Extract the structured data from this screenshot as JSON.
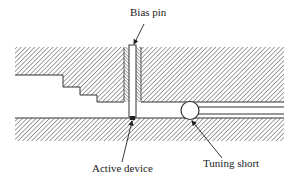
{
  "diagram": {
    "type": "waveguide-cavity-cross-section",
    "labels": {
      "bias_pin": "Bias pin",
      "active_device": "Active device",
      "tuning_short": "Tuning short"
    },
    "colors": {
      "line": "#333333",
      "hatch": "#555555",
      "background": "#ffffff"
    }
  }
}
